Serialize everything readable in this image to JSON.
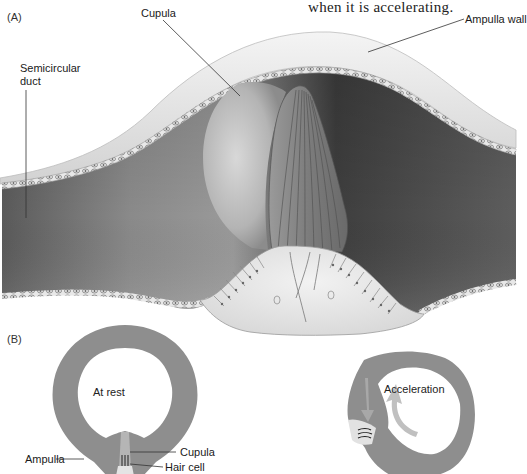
{
  "caption_fragment": "when it is accelerating.",
  "panel_a": {
    "label": "(A)",
    "callouts": {
      "cupula": "Cupula",
      "ampulla_wall": "Ampulla wall",
      "semicircular_duct_line1": "Semicircular",
      "semicircular_duct_line2": "duct"
    }
  },
  "panel_b": {
    "label": "(B)",
    "at_rest": {
      "title": "At rest",
      "callouts": {
        "ampulla": "Ampulla",
        "cupula": "Cupula",
        "hair_cell": "Hair cell"
      }
    },
    "acceleration": {
      "title": "Acceleration"
    }
  },
  "colors": {
    "duct_dark": "#4a4a4a",
    "duct_mid": "#7a7a7a",
    "membrane": "#e6e6e6",
    "ring_gray": "#8c8c8c",
    "arrow_light": "#b8b8b8"
  }
}
